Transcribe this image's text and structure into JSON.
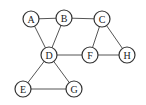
{
  "graph": {
    "nodes": [
      {
        "id": "A",
        "label": "A",
        "x": 31,
        "y": 19
      },
      {
        "id": "B",
        "label": "B",
        "x": 64,
        "y": 18
      },
      {
        "id": "C",
        "label": "C",
        "x": 102,
        "y": 19
      },
      {
        "id": "D",
        "label": "D",
        "x": 49,
        "y": 55
      },
      {
        "id": "F",
        "label": "F",
        "x": 90,
        "y": 55
      },
      {
        "id": "H",
        "label": "H",
        "x": 127,
        "y": 55
      },
      {
        "id": "E",
        "label": "E",
        "x": 23,
        "y": 89
      },
      {
        "id": "G",
        "label": "G",
        "x": 74,
        "y": 89
      }
    ],
    "edges": [
      [
        "A",
        "B"
      ],
      [
        "B",
        "C"
      ],
      [
        "A",
        "D"
      ],
      [
        "B",
        "D"
      ],
      [
        "D",
        "F"
      ],
      [
        "C",
        "F"
      ],
      [
        "C",
        "H"
      ],
      [
        "F",
        "H"
      ],
      [
        "D",
        "E"
      ],
      [
        "D",
        "G"
      ],
      [
        "E",
        "G"
      ]
    ],
    "node_radius": 8,
    "colors": {
      "edge": "#555555",
      "node_stroke": "#333333",
      "node_fill": "#ffffff",
      "text": "#222222"
    }
  }
}
